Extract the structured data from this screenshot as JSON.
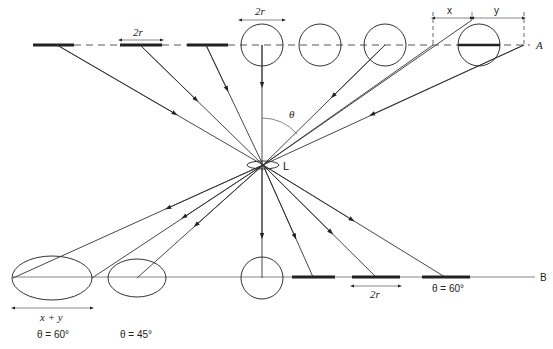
{
  "diagram": {
    "labels": {
      "plane_a": "A",
      "plane_b": "B",
      "lens": "L",
      "theta": "θ",
      "two_r_top_left": "2r",
      "two_r_top_circle": "2r",
      "two_r_bottom": "2r",
      "x": "x",
      "y": "y",
      "x_plus_y": "x + y",
      "theta_60_bottom_right": "θ = 60°",
      "theta_60_bottom_left": "θ = 60°",
      "theta_45_bottom_left": "θ = 45°"
    },
    "top_row": {
      "bars": [
        {
          "x1": 33,
          "x2": 74,
          "ray_origin": 57
        },
        {
          "x1": 120,
          "x2": 162,
          "ray_origin": 140
        },
        {
          "x1": 187,
          "x2": 228,
          "ray_origin": 206
        }
      ],
      "circles": [
        {
          "cx": 262,
          "cy": 45,
          "r": 21
        },
        {
          "cx": 320,
          "cy": 45,
          "r": 21
        },
        {
          "cx": 385,
          "cy": 45,
          "r": 21
        },
        {
          "cx": 479,
          "cy": 45,
          "r": 21
        }
      ]
    },
    "bottom_row": {
      "ellipses": [
        {
          "cx": 52,
          "cy": 278,
          "rx": 40,
          "ry": 22
        },
        {
          "cx": 137,
          "cy": 278,
          "rx": 29,
          "ry": 19
        }
      ],
      "circle": {
        "cx": 262,
        "cy": 278,
        "r": 21
      },
      "bars": [
        {
          "x1": 292,
          "x2": 335,
          "ray_end": 313
        },
        {
          "x1": 352,
          "x2": 400,
          "ray_end": 376
        },
        {
          "x1": 422,
          "x2": 470,
          "ray_end": 445
        }
      ]
    },
    "lens": {
      "cx": 263,
      "cy": 165
    }
  }
}
